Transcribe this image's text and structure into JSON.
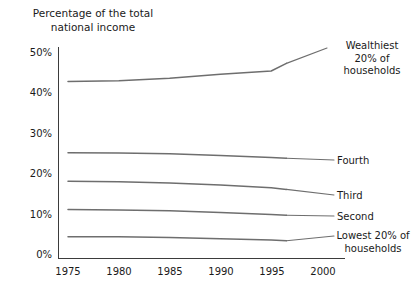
{
  "chart_data": {
    "type": "line",
    "title": "Percentage of the total\nnational income",
    "xlabel": "",
    "ylabel": "",
    "xlim": [
      1975,
      2000
    ],
    "ylim": [
      0,
      50
    ],
    "grid": false,
    "legend_position": "right-inline-labels",
    "x_ticks": [
      "1975",
      "1980",
      "1985",
      "1990",
      "1995",
      "2000"
    ],
    "y_ticks": [
      "0%",
      "10%",
      "20%",
      "30%",
      "40%",
      "50%"
    ],
    "x": [
      1975,
      1980,
      1985,
      1990,
      1995,
      1996.5
    ],
    "series": [
      {
        "name": "Wealthiest 20% of\nhouseholds",
        "label": "Wealthiest\n20% of\nhouseholds",
        "values": [
          43.8,
          44.0,
          44.6,
          45.6,
          46.4,
          48.3
        ],
        "color": "#6e6e6e"
      },
      {
        "name": "Fourth",
        "label": "Fourth",
        "values": [
          26.2,
          26.1,
          25.9,
          25.5,
          25.0,
          24.8
        ],
        "color": "#6e6e6e"
      },
      {
        "name": "Third",
        "label": "Third",
        "values": [
          19.1,
          19.0,
          18.7,
          18.2,
          17.5,
          17.1
        ],
        "color": "#6e6e6e"
      },
      {
        "name": "Second",
        "label": "Second",
        "values": [
          12.1,
          12.0,
          11.8,
          11.4,
          10.9,
          10.7
        ],
        "color": "#6e6e6e"
      },
      {
        "name": "Lowest 20% of\nhouseholds",
        "label": "Lowest 20% of\nhouseholds",
        "values": [
          5.4,
          5.4,
          5.2,
          4.9,
          4.6,
          4.4
        ],
        "color": "#6e6e6e"
      }
    ]
  },
  "axis": {
    "y_tick_50": "50%",
    "y_tick_40": "40%",
    "y_tick_30": "30%",
    "y_tick_20": "20%",
    "y_tick_10": "10%",
    "y_tick_0": "0%",
    "x_tick_1975": "1975",
    "x_tick_1980": "1980",
    "x_tick_1985": "1985",
    "x_tick_1990": "1990",
    "x_tick_1995": "1995",
    "x_tick_2000": "2000"
  },
  "labels": {
    "wealthiest": "Wealthiest\n20% of\nhouseholds",
    "fourth": "Fourth",
    "third": "Third",
    "second": "Second",
    "lowest": "Lowest 20% of\nhouseholds"
  }
}
